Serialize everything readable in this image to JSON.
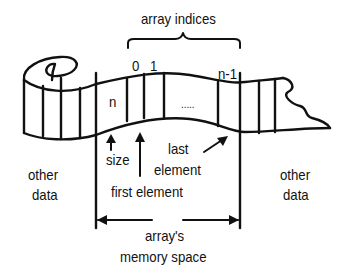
{
  "diagram": {
    "title_label": "array indices",
    "index_labels": {
      "first": "0",
      "second": "1",
      "last": "n-1"
    },
    "cell_labels": {
      "size_cell": "n",
      "ellipsis": "....."
    },
    "annotations": {
      "size": "size",
      "first_element": "first element",
      "last_element_line1": "last",
      "last_element_line2": "element"
    },
    "side_labels": {
      "left_line1": "other",
      "left_line2": "data",
      "right_line1": "other",
      "right_line2": "data"
    },
    "span_label": {
      "line1": "array's",
      "line2": "memory space"
    },
    "colors": {
      "stroke": "#111111",
      "background": "#ffffff"
    }
  }
}
